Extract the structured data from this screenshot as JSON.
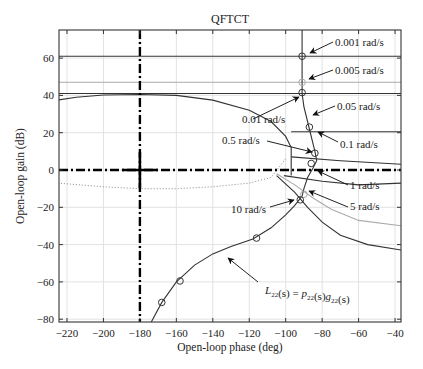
{
  "chart_data": {
    "type": "line",
    "title": "QFTCT",
    "xlabel": "Open-loop phase (deg)",
    "ylabel": "Open-loop gain (dB)",
    "xlim": [
      -225,
      -36
    ],
    "ylim": [
      -82,
      75
    ],
    "xticks": [
      -220,
      -200,
      -180,
      -160,
      -140,
      -120,
      -100,
      -80,
      -60,
      -40
    ],
    "yticks": [
      -80,
      -60,
      -40,
      -20,
      0,
      20,
      40,
      60
    ],
    "grid": true,
    "legend": "none",
    "critical_point": {
      "x": -180,
      "y": 0
    },
    "series": [
      {
        "name": "bound 0.001 rad/s",
        "style": "dark",
        "x": [
          -225,
          -36
        ],
        "y": [
          61,
          61
        ]
      },
      {
        "name": "bound 0.005 rad/s",
        "style": "light",
        "x": [
          -225,
          -36
        ],
        "y": [
          47,
          47
        ]
      },
      {
        "name": "bound 0.05 rad/s",
        "style": "dark",
        "x": [
          -225,
          -36
        ],
        "y": [
          41,
          41
        ]
      },
      {
        "name": "bound 0.01 rad/s",
        "style": "dark",
        "x": [
          -225,
          -215,
          -200,
          -180,
          -160,
          -140,
          -120,
          -108,
          -100,
          -97,
          -97
        ],
        "y": [
          37.5,
          39,
          40.2,
          40.5,
          40,
          37.5,
          32,
          26,
          18,
          12,
          -3
        ]
      },
      {
        "name": "bound 0.1 rad/s",
        "style": "dark",
        "x": [
          -97,
          -36
        ],
        "y": [
          20.5,
          20.5
        ]
      },
      {
        "name": "bound 0.5 rad/s",
        "style": "dark",
        "x": [
          -97,
          -70,
          -36
        ],
        "y": [
          7,
          5,
          3
        ]
      },
      {
        "name": "bound 1 rad/s",
        "style": "dark",
        "x": [
          -101,
          -80,
          -60,
          -36
        ],
        "y": [
          -3,
          -6,
          -8,
          -7
        ]
      },
      {
        "name": "bound 0.5 rad/s dotted lower",
        "style": "dotted",
        "x": [
          -225,
          -200,
          -180,
          -160,
          -140,
          -120,
          -108,
          -100
        ],
        "y": [
          -7,
          -9,
          -10,
          -10,
          -9,
          -7,
          -4,
          6
        ]
      },
      {
        "name": "bound 5 rad/s",
        "style": "light",
        "x": [
          -105,
          -95,
          -85,
          -75,
          -60,
          -36
        ],
        "y": [
          -2,
          -8,
          -15,
          -21,
          -27,
          -30
        ]
      },
      {
        "name": "bound 10 rad/s",
        "style": "dark",
        "x": [
          -105,
          -95,
          -88,
          -80,
          -70,
          -55,
          -36
        ],
        "y": [
          -3,
          -12,
          -20,
          -28,
          -35,
          -40,
          -43
        ]
      },
      {
        "name": "L22(s) = p22(s)g22(s)",
        "style": "loop",
        "x": [
          -174,
          -168,
          -160,
          -150,
          -140,
          -130,
          -118,
          -108,
          -100,
          -95,
          -91,
          -90,
          -88,
          -85,
          -83,
          -84,
          -87,
          -90,
          -91,
          -91
        ],
        "y": [
          -82,
          -71,
          -60,
          -51,
          -45,
          -41,
          -37,
          -31,
          -24,
          -19,
          -14,
          -10,
          -4,
          1,
          5,
          10,
          22,
          34,
          41,
          75
        ]
      }
    ],
    "markers": [
      {
        "x": -91,
        "y": 61,
        "label": "0.001 rad/s"
      },
      {
        "x": -91,
        "y": 47,
        "label": "0.005 rad/s",
        "light": true
      },
      {
        "x": -91,
        "y": 41.5,
        "label": "0.01 rad/s"
      },
      {
        "x": -87,
        "y": 23,
        "label": "0.1 rad/s"
      },
      {
        "x": -84,
        "y": 9,
        "label": "0.5 rad/s"
      },
      {
        "x": -86,
        "y": 3.5,
        "label": "1 rad/s"
      },
      {
        "x": -90,
        "y": -13,
        "label": "5 rad/s",
        "light": true
      },
      {
        "x": -92,
        "y": -16,
        "label": "10 rad/s"
      },
      {
        "x": -116,
        "y": -36.5,
        "label": ""
      },
      {
        "x": -158,
        "y": -59.5,
        "label": ""
      },
      {
        "x": -168,
        "y": -71,
        "label": ""
      }
    ],
    "annotations": [
      {
        "text": "0.001 rad/s",
        "tx": 335,
        "ty": 46,
        "ax": 310,
        "ay": 53,
        "fromx": 333,
        "fromy": 42
      },
      {
        "text": "0.005 rad/s",
        "tx": 335,
        "ty": 74,
        "ax": 309,
        "ay": 79,
        "fromx": 333,
        "fromy": 70
      },
      {
        "text": "0.05 rad/s",
        "tx": 337,
        "ty": 110,
        "ax": 313,
        "ay": 115,
        "fromx": 335,
        "fromy": 106
      },
      {
        "text": "0.01 rad/s",
        "tx": 242,
        "ty": 123,
        "ax": 299,
        "ay": 97,
        "fromx": 253,
        "fromy": 119
      },
      {
        "text": "0.1 rad/s",
        "tx": 340,
        "ty": 148,
        "ax": 318,
        "ay": 132,
        "fromx": 338,
        "fromy": 142
      },
      {
        "text": "0.5 rad/s",
        "tx": 222,
        "ty": 144,
        "ax": 312,
        "ay": 152,
        "fromx": 267,
        "fromy": 141
      },
      {
        "text": "1 rad/s",
        "tx": 350,
        "ty": 189,
        "ax": 318,
        "ay": 171,
        "fromx": 348,
        "fromy": 185
      },
      {
        "text": "5 rad/s",
        "tx": 350,
        "ty": 210,
        "ax": 309,
        "ay": 191,
        "fromx": 348,
        "fromy": 207
      },
      {
        "text": "10 rad/s",
        "tx": 231,
        "ty": 213,
        "ax": 294,
        "ay": 200,
        "fromx": 270,
        "fromy": 207
      },
      {
        "text": "L22(s) = p22(s)g22(s)",
        "tx": 265,
        "ty": 294,
        "ax": 228,
        "ay": 258,
        "fromx": 258,
        "fromy": 282
      }
    ]
  },
  "labels": {
    "title": "QFTCT",
    "xlabel": "Open-loop phase (deg)",
    "ylabel": "Open-loop gain (dB)",
    "loop_eq": {
      "L": "L",
      "L_sub": "22",
      "mid1": "(s) = ",
      "p": "p",
      "p_sub": "22",
      "mid2": "(s)",
      "g": "g",
      "g_sub": "22",
      "end": "(s)"
    }
  },
  "colors": {
    "dark": "#333333",
    "light": "#aaaaaa",
    "grid": "#e2e2e2",
    "axis": "#333333",
    "critical": "#000000"
  }
}
